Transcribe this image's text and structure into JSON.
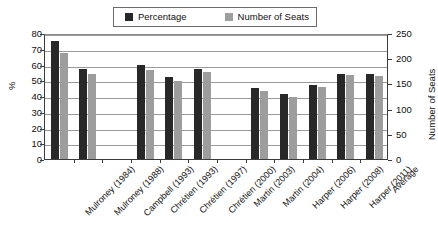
{
  "legend": {
    "entries": [
      {
        "label": "Percentage",
        "color": "#282828",
        "icon": "square-swatch"
      },
      {
        "label": "Number of Seats",
        "color": "#9d9d9d",
        "icon": "square-swatch"
      }
    ]
  },
  "axes": {
    "left_title": "%",
    "right_title": "Number of Seats",
    "left_ticks": [
      "0",
      "10",
      "20",
      "30",
      "40",
      "50",
      "60",
      "70",
      "80"
    ],
    "right_ticks": [
      "0",
      "50",
      "100",
      "150",
      "200",
      "250"
    ]
  },
  "chart_data": {
    "type": "bar",
    "title": "",
    "xlabel": "",
    "ylabel": "%",
    "y2label": "Number of Seats",
    "ylim": [
      0,
      80
    ],
    "y2lim": [
      0,
      250
    ],
    "grid": true,
    "legend_position": "top-center",
    "categories": [
      "Mulroney (1984)",
      "Mulroney (1988)",
      "Campbell (1993)",
      "Chrétien (1993)",
      "Chrétien (1997)",
      "Chrétien (2000)",
      "Martin (2003)",
      "Martin (2004)",
      "Harper (2006)",
      "Harper (2008)",
      "Harper (2011)",
      "Average"
    ],
    "series": [
      {
        "name": "Percentage",
        "axis": "left",
        "color": "#282828",
        "values": [
          75,
          57,
          null,
          60,
          52,
          57,
          null,
          45,
          41,
          47,
          54,
          54
        ]
      },
      {
        "name": "Number of Seats",
        "axis": "right",
        "color": "#9d9d9d",
        "values": [
          211,
          169,
          null,
          177,
          155,
          172,
          null,
          135,
          124,
          143,
          166,
          165
        ]
      }
    ]
  }
}
